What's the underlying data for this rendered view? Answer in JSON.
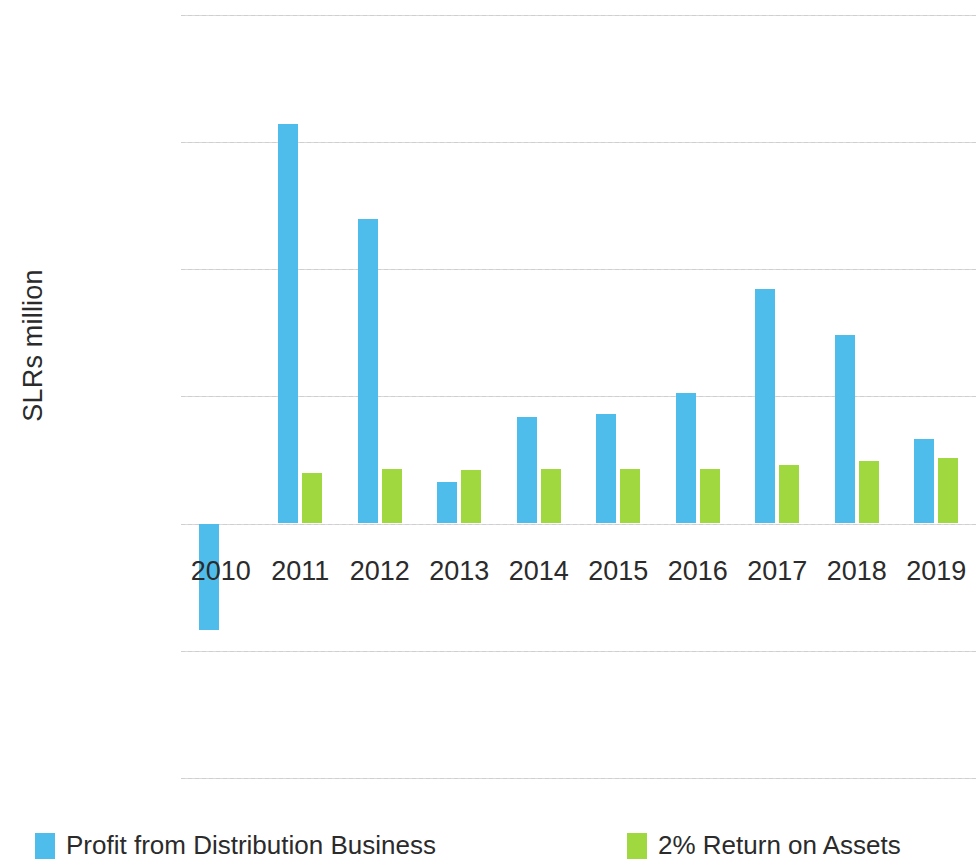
{
  "chart_data": {
    "type": "bar",
    "title": "",
    "xlabel": "",
    "ylabel": "SLRs million",
    "categories": [
      "2010",
      "2011",
      "2012",
      "2013",
      "2014",
      "2015",
      "2016",
      "2017",
      "2018",
      "2019"
    ],
    "series": [
      {
        "name": "Profit from Distribution Business",
        "color": "#4fbdeb",
        "values": [
          -417,
          1571,
          1197,
          165,
          417,
          429,
          512,
          921,
          740,
          331
        ]
      },
      {
        "name": "2% Return on Assets",
        "color": "#9fd93f",
        "values": [
          null,
          197,
          216,
          209,
          213,
          216,
          213,
          228,
          244,
          256
        ]
      }
    ],
    "ylim": [
      -1000,
      2000
    ],
    "y_ticks": [
      "2,000",
      "1,500",
      "1,000",
      "500",
      "0",
      "-500",
      "-1,000"
    ],
    "y_tick_values": [
      2000,
      1500,
      1000,
      500,
      0,
      -500,
      -1000
    ],
    "grid": true,
    "legend_position": "bottom"
  },
  "legend": {
    "entries": [
      {
        "label": "Profit from Distribution Business",
        "color": "#4fbdeb"
      },
      {
        "label": "2% Return on Assets",
        "color": "#9fd93f"
      }
    ]
  }
}
